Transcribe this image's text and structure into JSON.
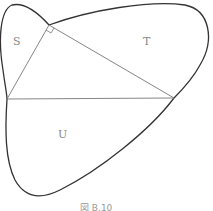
{
  "diagram": {
    "labels": {
      "S": "S",
      "T": "T",
      "U": "U"
    },
    "caption": "図 B.10",
    "right_angle_at": "top vertex",
    "stroke_color": "#333333",
    "line_color": "#777777"
  }
}
